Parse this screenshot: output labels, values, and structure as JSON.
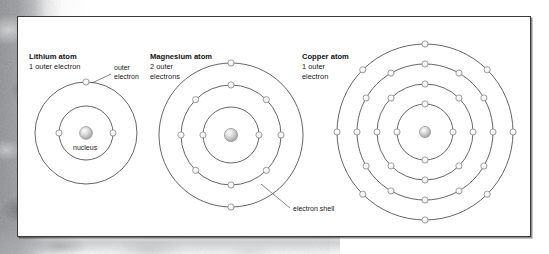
{
  "figure": {
    "background_color": "#9a9b9e",
    "panel_color": "#ffffff",
    "border_color": "#3a3a3a",
    "shell_stroke_color": "#4a4a4a",
    "electron_fill_color": "#fafafa",
    "electron_stroke_color": "#8a8a8a",
    "nucleus_fill_color": "#cfcfcf"
  },
  "atoms": [
    {
      "id": "lithium",
      "title": "Lithium atom",
      "subtitle": "1 outer electron",
      "cx": 68,
      "cy": 116,
      "shells": [
        {
          "radius": 27,
          "electrons": 2,
          "start_angle": 180
        },
        {
          "radius": 51,
          "electrons": 1,
          "start_angle": 270
        }
      ],
      "nucleus_radius": 6.4,
      "title_x": 11,
      "title_y": 42,
      "sub_x": 11,
      "sub_y": 52
    },
    {
      "id": "magnesium",
      "title": "Magnesium atom",
      "subtitle_line1": "2 outer",
      "subtitle_line2": "electrons",
      "cx": 213,
      "cy": 118,
      "shells": [
        {
          "radius": 28,
          "electrons": 2,
          "start_angle": 180
        },
        {
          "radius": 50,
          "electrons": 8,
          "start_angle": 180
        },
        {
          "radius": 72,
          "electrons": 2,
          "start_angle": 270
        }
      ],
      "nucleus_radius": 6.6,
      "title_x": 132,
      "title_y": 42,
      "sub_x": 132,
      "sub_y": 52
    },
    {
      "id": "copper",
      "title": "Copper atom",
      "subtitle_line1": "1 outer",
      "subtitle_line2": "electron",
      "cx": 407,
      "cy": 115,
      "shells": [
        {
          "radius": 28,
          "electrons": 4,
          "start_angle": 180
        },
        {
          "radius": 48,
          "electrons": 8,
          "start_angle": 180
        },
        {
          "radius": 68,
          "electrons": 12,
          "start_angle": 180
        },
        {
          "radius": 88,
          "electrons": 8,
          "start_angle": 180
        }
      ],
      "nucleus_radius": 5.6,
      "title_x": 284,
      "title_y": 42,
      "sub_x": 284,
      "sub_y": 52
    }
  ],
  "callouts": [
    {
      "id": "outer-electron",
      "line1": "outer",
      "line2": "electron",
      "text_x": 96,
      "text_y": 53,
      "leader": "M 93 57 L 74 66"
    },
    {
      "id": "nucleus",
      "line1": "nucleus",
      "text_x": 55,
      "text_y": 133,
      "leader": ""
    },
    {
      "id": "electron-shell",
      "line1": "electron shell",
      "text_x": 275,
      "text_y": 194,
      "leader": "M 272 191 L 243 167"
    }
  ],
  "chart_data": {
    "type": "diagram",
    "series": [
      {
        "name": "Lithium atom",
        "shell_occupancy": [
          2,
          1
        ],
        "outer_electrons": 1,
        "shell_count": 2
      },
      {
        "name": "Magnesium atom",
        "shell_occupancy": [
          2,
          8,
          2
        ],
        "outer_electrons": 2,
        "shell_count": 3
      },
      {
        "name": "Copper atom",
        "shell_occupancy": [
          4,
          8,
          12,
          8
        ],
        "outer_electrons": 1,
        "shell_count": 4
      }
    ],
    "annotations": [
      "outer electron",
      "nucleus",
      "electron shell"
    ],
    "legend": "none",
    "grid": false
  }
}
